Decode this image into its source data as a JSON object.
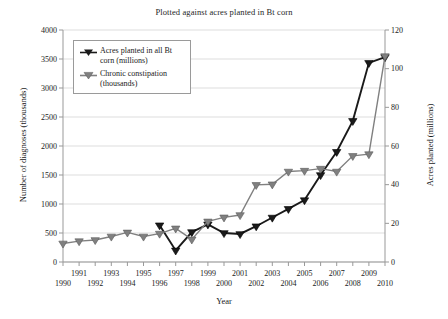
{
  "chart_data": {
    "type": "line",
    "title": "Plotted against acres planted in Bt corn",
    "xlabel": "Year",
    "ylabel": "Number of diagnoses (thousands)",
    "ylabel_right": "Acres planted (millions)",
    "grid": true,
    "legend_position": "top-left",
    "x": [
      1990,
      1991,
      1992,
      1993,
      1994,
      1995,
      1996,
      1997,
      1998,
      1999,
      2000,
      2001,
      2002,
      2003,
      2004,
      2005,
      2006,
      2007,
      2008,
      2009,
      2010
    ],
    "xlim": [
      1990,
      2010
    ],
    "xticks_top_row": [
      "1991",
      "1993",
      "1995",
      "1997",
      "1999",
      "2001",
      "2003",
      "2005",
      "2007",
      "2009"
    ],
    "xticks_bottom_row": [
      "1990",
      "1992",
      "1994",
      "1996",
      "1998",
      "2000",
      "2002",
      "2004",
      "2006",
      "2008",
      "2010"
    ],
    "ylim": [
      0,
      4000
    ],
    "yticks": [
      "0",
      "500",
      "1000",
      "1500",
      "2000",
      "2500",
      "3000",
      "3500",
      "4000"
    ],
    "ylim_right": [
      0,
      120
    ],
    "yticks_right": [
      "0",
      "20",
      "40",
      "60",
      "80",
      "100",
      "120"
    ],
    "series": [
      {
        "name": "Acres planted in all Bt corn (millions)",
        "axis": "right",
        "color": "#1a1a1a",
        "marker": "triangle-down",
        "x": [
          1996,
          1997,
          1998,
          1999,
          2000,
          2001,
          2002,
          2003,
          2004,
          2005,
          2006,
          2007,
          2008,
          2009,
          2010
        ],
        "values": [
          19.0,
          6.0,
          15.5,
          19.5,
          15.0,
          14.5,
          18.5,
          23.0,
          27.5,
          32.0,
          45.0,
          57.0,
          73.0,
          103.0,
          106.0
        ]
      },
      {
        "name": "Chronic constipation (thousands)",
        "axis": "left",
        "color": "#808080",
        "marker": "triangle-down",
        "x": [
          1990,
          1991,
          1992,
          1993,
          1994,
          1995,
          1996,
          1997,
          1998,
          1999,
          2000,
          2001,
          2002,
          2003,
          2004,
          2005,
          2006,
          2007,
          2008,
          2009,
          2010
        ],
        "values": [
          320,
          360,
          380,
          440,
          510,
          440,
          490,
          580,
          390,
          700,
          770,
          810,
          1330,
          1340,
          1560,
          1575,
          1610,
          1560,
          1830,
          1860,
          3550
        ]
      }
    ]
  },
  "legend": {
    "items": [
      {
        "label_line1": "Acres planted in all Bt",
        "label_line2": "corn (millions)"
      },
      {
        "label_line1": "Chronic constipation",
        "label_line2": "(thousands)"
      }
    ]
  }
}
